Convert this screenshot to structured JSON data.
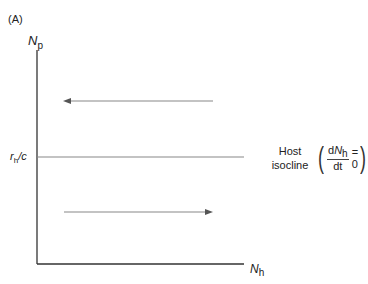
{
  "figure": {
    "panel_label": "(A)",
    "y_axis_label": "N",
    "y_axis_subscript": "p",
    "x_axis_label": "N",
    "x_axis_subscript": "h",
    "isocline_level_label_r": "r",
    "isocline_level_label_sub": "h",
    "isocline_level_label_rest": "/c",
    "isocline_name_line1": "Host",
    "isocline_name_line2": "isocline",
    "equation_numerator_d": "d",
    "equation_numerator_N": "N",
    "equation_numerator_sub": "h",
    "equation_denominator": "dt",
    "equation_rhs": "= 0",
    "arrows": [
      {
        "direction": "left",
        "position": "above isocline"
      },
      {
        "direction": "right",
        "position": "below isocline"
      }
    ],
    "colors": {
      "axis": "#333333",
      "isocline": "#888888",
      "arrow": "#888888",
      "text": "#222222"
    }
  }
}
